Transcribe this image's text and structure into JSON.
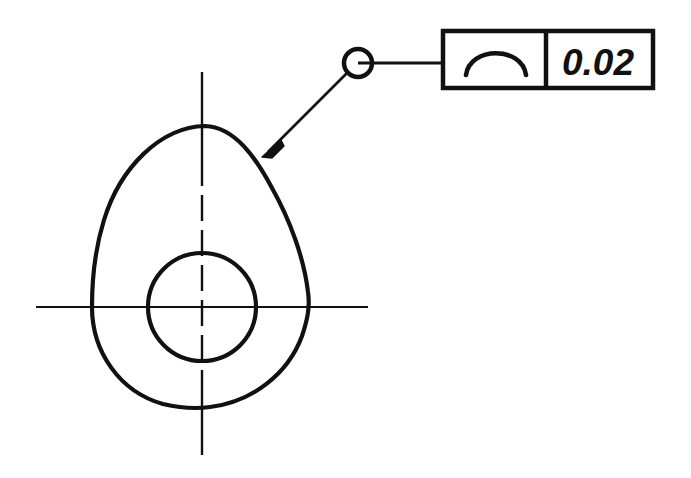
{
  "drawing": {
    "title": "Profile tolerance of a cam plate",
    "background_color": "#ffffff",
    "line_color": "#111111",
    "width": 691,
    "height": 478
  },
  "part": {
    "name": "cam-plate-outline",
    "description": "Teardrop / egg shaped cam plate outline",
    "center": {
      "x": 202,
      "y": 307
    },
    "extents": {
      "left_x": 92,
      "right_x": 310,
      "top_y": 126,
      "bottom_y": 408
    },
    "outline_stroke_width": 4.2
  },
  "bore": {
    "name": "center-bore-circle",
    "center": {
      "x": 202,
      "y": 307
    },
    "radius": 54,
    "stroke_width": 4.2
  },
  "centerlines": {
    "horizontal": {
      "name": "horizontal-centerline",
      "y": 307,
      "x_start": 36,
      "x_end": 368,
      "style": "solid"
    },
    "vertical": {
      "name": "vertical-centerline",
      "x": 202,
      "y_start": 72,
      "y_end": 455,
      "style": "dash-dot-inside-part"
    }
  },
  "leader": {
    "name": "all-around-leader",
    "arrow_tip": {
      "x": 262,
      "y": 157
    },
    "bend": {
      "x": 344,
      "y": 63
    },
    "frame_attach": {
      "x": 443,
      "y": 63
    },
    "all_around_circle": {
      "name": "all-around-symbol",
      "center": {
        "x": 358,
        "y": 63
      },
      "radius": 14,
      "stroke_width": 4.5,
      "meaning": "all around"
    }
  },
  "feature_control_frame": {
    "name": "feature-control-frame",
    "box": {
      "x": 443,
      "y": 31,
      "width": 210,
      "height": 57
    },
    "divider_x": 546,
    "stroke_width": 4.5,
    "symbol": {
      "name": "profile-of-a-line-symbol",
      "glyph": "arc",
      "label": "profile of a line"
    },
    "tolerance_value": "0.02"
  }
}
